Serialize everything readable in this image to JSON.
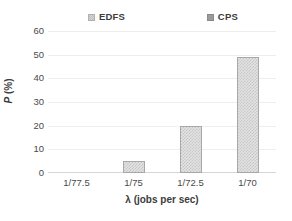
{
  "chart_data": {
    "type": "bar",
    "title": "",
    "subtitle": "",
    "categories": [
      "1/77.5",
      "1/75",
      "1/72.5",
      "1/70"
    ],
    "series": [
      {
        "name": "EDFS",
        "values": [
          0,
          0,
          0,
          0
        ],
        "color": "#e2e2e2"
      },
      {
        "name": "CPS",
        "values": [
          0,
          5,
          20,
          49
        ],
        "color": "#e3e3e3"
      }
    ],
    "xlabel": "λ (jobs per sec)",
    "ylabel_symbol": "P",
    "ylabel_unit": " (%)",
    "ylabel": "P (%)",
    "ylim": [
      0,
      60
    ],
    "ytick_values": [
      60,
      50,
      40,
      30,
      20,
      10,
      0
    ],
    "ytick_labels": [
      "60",
      "50",
      "40",
      "30",
      "20",
      "10",
      "0"
    ],
    "grid": true,
    "legend_position": "top",
    "background_color": "#ffffff",
    "gridline_color": "#eeeeee",
    "axis_color": "#d6d6d6"
  },
  "legend": {
    "entries": [
      {
        "label": "EDFS",
        "swatch": "edfs-swatch-icon"
      },
      {
        "label": "CPS",
        "swatch": "cps-swatch-icon"
      }
    ]
  }
}
